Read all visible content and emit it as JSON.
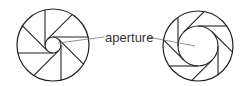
{
  "diagram": {
    "label": "aperture",
    "colors": {
      "stroke": "#222222",
      "leader": "#777777",
      "text": "#333333",
      "background": "#ffffff"
    },
    "irises": [
      {
        "name": "small-aperture-iris",
        "cx": 53,
        "cy": 45,
        "r": 36,
        "aperture_r": 8,
        "blades": 8
      },
      {
        "name": "large-aperture-iris",
        "cx": 198,
        "cy": 46,
        "r": 35,
        "aperture_r": 20,
        "blades": 8
      }
    ]
  }
}
